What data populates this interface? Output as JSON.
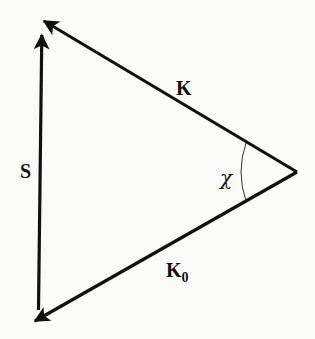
{
  "diagram": {
    "vectors": [
      {
        "name": "K",
        "label": "K",
        "from": [
          297,
          172
        ],
        "to": [
          42,
          20
        ]
      },
      {
        "name": "K0",
        "label": "K",
        "subscript": "0",
        "from": [
          297,
          172
        ],
        "to": [
          33,
          322
        ]
      },
      {
        "name": "S",
        "label": "S",
        "from": [
          39,
          310
        ],
        "to": [
          42,
          33
        ]
      }
    ],
    "angle": {
      "label": "χ",
      "vertex": [
        297,
        172
      ]
    },
    "colors": {
      "stroke": "#111111",
      "background": "#fbfbfa"
    }
  }
}
